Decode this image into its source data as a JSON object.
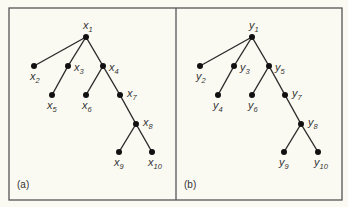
{
  "figure": {
    "panels": [
      {
        "id": "a",
        "label": "(a)",
        "variable": "x",
        "nodes": [
          {
            "id": "1",
            "base": "x",
            "sub": "1",
            "x": 86,
            "y": 37,
            "lx": 83,
            "ly": 29,
            "anchor": "middle"
          },
          {
            "id": "2",
            "base": "x",
            "sub": "2",
            "x": 34,
            "y": 66,
            "lx": 30,
            "ly": 80,
            "anchor": "start"
          },
          {
            "id": "3",
            "base": "x",
            "sub": "3",
            "x": 68,
            "y": 66,
            "lx": 74,
            "ly": 71,
            "anchor": "start"
          },
          {
            "id": "4",
            "base": "x",
            "sub": "4",
            "x": 103,
            "y": 66,
            "lx": 109,
            "ly": 71,
            "anchor": "start"
          },
          {
            "id": "5",
            "base": "x",
            "sub": "5",
            "x": 52,
            "y": 95,
            "lx": 47,
            "ly": 109,
            "anchor": "start"
          },
          {
            "id": "6",
            "base": "x",
            "sub": "6",
            "x": 86,
            "y": 95,
            "lx": 82,
            "ly": 109,
            "anchor": "start"
          },
          {
            "id": "7",
            "base": "x",
            "sub": "7",
            "x": 120,
            "y": 95,
            "lx": 127,
            "ly": 97,
            "anchor": "start"
          },
          {
            "id": "8",
            "base": "x",
            "sub": "8",
            "x": 136,
            "y": 124,
            "lx": 143,
            "ly": 126,
            "anchor": "start"
          },
          {
            "id": "9",
            "base": "x",
            "sub": "9",
            "x": 119,
            "y": 152,
            "lx": 114,
            "ly": 166,
            "anchor": "start"
          },
          {
            "id": "10",
            "base": "x",
            "sub": "10",
            "x": 152,
            "y": 152,
            "lx": 148,
            "ly": 166,
            "anchor": "start"
          }
        ],
        "edges": [
          [
            "1",
            "2"
          ],
          [
            "1",
            "3"
          ],
          [
            "1",
            "4"
          ],
          [
            "3",
            "5"
          ],
          [
            "4",
            "6"
          ],
          [
            "4",
            "7"
          ],
          [
            "7",
            "8"
          ],
          [
            "8",
            "9"
          ],
          [
            "8",
            "10"
          ]
        ]
      },
      {
        "id": "b",
        "label": "(b)",
        "variable": "y",
        "nodes": [
          {
            "id": "1",
            "base": "y",
            "sub": "1",
            "x": 252,
            "y": 37,
            "lx": 249,
            "ly": 29,
            "anchor": "middle"
          },
          {
            "id": "2",
            "base": "y",
            "sub": "2",
            "x": 200,
            "y": 66,
            "lx": 196,
            "ly": 80,
            "anchor": "start"
          },
          {
            "id": "3",
            "base": "y",
            "sub": "3",
            "x": 234,
            "y": 66,
            "lx": 240,
            "ly": 71,
            "anchor": "start"
          },
          {
            "id": "5",
            "base": "y",
            "sub": "5",
            "x": 269,
            "y": 66,
            "lx": 275,
            "ly": 71,
            "anchor": "start"
          },
          {
            "id": "4",
            "base": "y",
            "sub": "4",
            "x": 218,
            "y": 95,
            "lx": 213,
            "ly": 109,
            "anchor": "start"
          },
          {
            "id": "6",
            "base": "y",
            "sub": "6",
            "x": 252,
            "y": 95,
            "lx": 248,
            "ly": 109,
            "anchor": "start"
          },
          {
            "id": "7",
            "base": "y",
            "sub": "7",
            "x": 285,
            "y": 95,
            "lx": 292,
            "ly": 97,
            "anchor": "start"
          },
          {
            "id": "8",
            "base": "y",
            "sub": "8",
            "x": 301,
            "y": 124,
            "lx": 308,
            "ly": 126,
            "anchor": "start"
          },
          {
            "id": "9",
            "base": "y",
            "sub": "9",
            "x": 284,
            "y": 152,
            "lx": 279,
            "ly": 166,
            "anchor": "start"
          },
          {
            "id": "10",
            "base": "y",
            "sub": "10",
            "x": 318,
            "y": 152,
            "lx": 314,
            "ly": 166,
            "anchor": "start"
          }
        ],
        "edges": [
          [
            "1",
            "2"
          ],
          [
            "1",
            "3"
          ],
          [
            "1",
            "5"
          ],
          [
            "3",
            "4"
          ],
          [
            "5",
            "6"
          ],
          [
            "5",
            "7"
          ],
          [
            "7",
            "8"
          ],
          [
            "8",
            "9"
          ],
          [
            "8",
            "10"
          ]
        ]
      }
    ],
    "colors": {
      "background": "#fbfaf2",
      "frame": "#555555",
      "edge": "#2a2a2a",
      "node": "#111111",
      "text": "#333333"
    }
  }
}
